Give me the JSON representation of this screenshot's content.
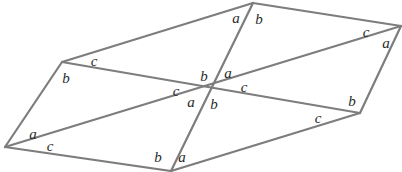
{
  "figure": {
    "type": "geometry-diagram",
    "width": 402,
    "height": 172,
    "background_color": "#ffffff",
    "stroke_color": "#7d7d7d",
    "stroke_width": 2.2,
    "label_color": "#2b2b2b",
    "label_font_size": 15
  },
  "vertices": {
    "top_left": {
      "name": "top-left-vertex",
      "x": 62,
      "y": 62
    },
    "top": {
      "name": "top-vertex",
      "x": 253,
      "y": 3
    },
    "right": {
      "name": "right-vertex",
      "x": 401,
      "y": 26
    },
    "bottom_right": {
      "name": "bottom-right-vertex",
      "x": 360,
      "y": 113
    },
    "bottom": {
      "name": "bottom-vertex",
      "x": 171,
      "y": 171
    },
    "bottom_left": {
      "name": "bottom-left-vertex",
      "x": 5,
      "y": 147
    },
    "center": {
      "name": "center-intersection",
      "x": 212,
      "y": 86
    }
  },
  "edges": [
    {
      "name": "edge-top-left-to-top",
      "from": "top_left",
      "to": "top"
    },
    {
      "name": "edge-top-to-right",
      "from": "top",
      "to": "right"
    },
    {
      "name": "edge-right-to-bottom-right",
      "from": "right",
      "to": "bottom_right"
    },
    {
      "name": "edge-bottom-right-to-bottom",
      "from": "bottom_right",
      "to": "bottom"
    },
    {
      "name": "edge-bottom-to-bottom-left",
      "from": "bottom",
      "to": "bottom_left"
    },
    {
      "name": "edge-bottom-left-to-top-left",
      "from": "bottom_left",
      "to": "top_left"
    },
    {
      "name": "diagonal-top-left-to-bottom-right",
      "from": "top_left",
      "to": "bottom_right"
    },
    {
      "name": "diagonal-top-to-bottom",
      "from": "top",
      "to": "bottom"
    },
    {
      "name": "diagonal-bottom-left-to-right",
      "from": "bottom_left",
      "to": "right"
    }
  ],
  "labels": [
    {
      "name": "label-top-a",
      "text": "a",
      "x": 236,
      "y": 18,
      "size": 15
    },
    {
      "name": "label-top-b",
      "text": "b",
      "x": 259,
      "y": 19,
      "size": 15
    },
    {
      "name": "label-right-c",
      "text": "c",
      "x": 366,
      "y": 32,
      "size": 15
    },
    {
      "name": "label-right-a",
      "text": "a",
      "x": 386,
      "y": 43,
      "size": 15
    },
    {
      "name": "label-top-left-c",
      "text": "c",
      "x": 94,
      "y": 61,
      "size": 15
    },
    {
      "name": "label-top-left-b",
      "text": "b",
      "x": 66,
      "y": 78,
      "size": 15
    },
    {
      "name": "label-center-b-upper",
      "text": "b",
      "x": 204,
      "y": 76,
      "size": 15
    },
    {
      "name": "label-center-a-upper",
      "text": "a",
      "x": 228,
      "y": 73,
      "size": 15
    },
    {
      "name": "label-center-c-left",
      "text": "c",
      "x": 176,
      "y": 91,
      "size": 15
    },
    {
      "name": "label-center-c-right",
      "text": "c",
      "x": 244,
      "y": 87,
      "size": 15
    },
    {
      "name": "label-center-a-lower",
      "text": "a",
      "x": 191,
      "y": 102,
      "size": 15
    },
    {
      "name": "label-center-b-lower",
      "text": "b",
      "x": 214,
      "y": 104,
      "size": 15
    },
    {
      "name": "label-bottom-right-b",
      "text": "b",
      "x": 352,
      "y": 101,
      "size": 15
    },
    {
      "name": "label-bottom-right-c",
      "text": "c",
      "x": 318,
      "y": 118,
      "size": 15
    },
    {
      "name": "label-bottom-left-a",
      "text": "a",
      "x": 33,
      "y": 134,
      "size": 15
    },
    {
      "name": "label-bottom-left-c",
      "text": "c",
      "x": 50,
      "y": 146,
      "size": 15
    },
    {
      "name": "label-bottom-b",
      "text": "b",
      "x": 158,
      "y": 157,
      "size": 15
    },
    {
      "name": "label-bottom-a",
      "text": "a",
      "x": 182,
      "y": 157,
      "size": 15
    }
  ]
}
